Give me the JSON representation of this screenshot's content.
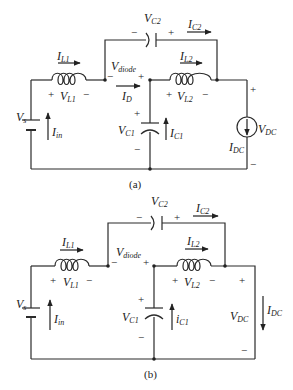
{
  "figure": {
    "circuits": [
      {
        "id": "a",
        "caption": "(a)",
        "labels": {
          "Vs": {
            "main": "V",
            "sub": "s"
          },
          "Iin": {
            "main": "I",
            "sub": "in"
          },
          "IL1": {
            "main": "I",
            "sub": "L1"
          },
          "VL1": {
            "main": "V",
            "sub": "L1"
          },
          "Vdiode": {
            "main": "V",
            "sub": "diode"
          },
          "ID": {
            "main": "I",
            "sub": "D"
          },
          "VC1": {
            "main": "V",
            "sub": "C1"
          },
          "IC1": {
            "main": "I",
            "sub": "C1"
          },
          "VC2": {
            "main": "V",
            "sub": "C2"
          },
          "IC2": {
            "main": "I",
            "sub": "C2"
          },
          "IL2": {
            "main": "I",
            "sub": "L2"
          },
          "VL2": {
            "main": "V",
            "sub": "L2"
          },
          "VDC": {
            "main": "V",
            "sub": "DC"
          },
          "IDC": {
            "main": "I",
            "sub": "DC"
          }
        },
        "polarity": {
          "plus": "+",
          "minus": "−"
        }
      },
      {
        "id": "b",
        "caption": "(b)",
        "labels": {
          "Vs": {
            "main": "V",
            "sub": "s"
          },
          "Iin": {
            "main": "I",
            "sub": "in"
          },
          "IL1": {
            "main": "I",
            "sub": "L1"
          },
          "VL1": {
            "main": "V",
            "sub": "L1"
          },
          "Vdiode": {
            "main": "V",
            "sub": "diode"
          },
          "VC1": {
            "main": "V",
            "sub": "C1"
          },
          "IC1": {
            "main": "i",
            "sub": "C1"
          },
          "VC2": {
            "main": "V",
            "sub": "C2"
          },
          "IC2": {
            "main": "I",
            "sub": "C2"
          },
          "IL2": {
            "main": "I",
            "sub": "L2"
          },
          "VL2": {
            "main": "V",
            "sub": "L2"
          },
          "VDC": {
            "main": "V",
            "sub": "DC"
          },
          "IDC": {
            "main": "I",
            "sub": "DC"
          }
        },
        "polarity": {
          "plus": "+",
          "minus": "−"
        }
      }
    ]
  }
}
